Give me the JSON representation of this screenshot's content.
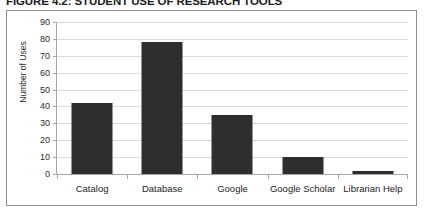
{
  "figure": {
    "title": "FIGURE 4.2: STUDENT USE OF RESEARCH TOOLS"
  },
  "colors": {
    "bar": "#2e2e2e",
    "gridline": "#d9d9d9",
    "axis": "#a6a6a6",
    "frame": "#8d8d8d",
    "text": "#1d1d1d",
    "background": "#ffffff"
  },
  "chart_data": {
    "type": "bar",
    "title": "FIGURE 4.2: STUDENT USE OF RESEARCH TOOLS",
    "xlabel": "",
    "ylabel": "Number of Uses",
    "categories": [
      "Catalog",
      "Database",
      "Google",
      "Google Scholar",
      "Librarian Help"
    ],
    "values": [
      42,
      78,
      35,
      10,
      2
    ],
    "ylim": [
      0,
      90
    ],
    "ytick_step": 10,
    "yticks": [
      0,
      10,
      20,
      30,
      40,
      50,
      60,
      70,
      80,
      90
    ],
    "ytick_labels": [
      "0",
      "10",
      "20",
      "30",
      "40",
      "50",
      "60",
      "70",
      "80",
      "90"
    ],
    "grid": true,
    "grid_axis": "y",
    "legend": false,
    "legend_position": "none",
    "series": [
      {
        "name": "Number of Uses",
        "values": [
          42,
          78,
          35,
          10,
          2
        ]
      }
    ]
  }
}
